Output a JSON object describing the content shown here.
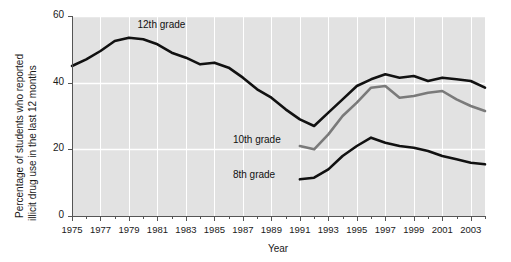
{
  "chart_data": {
    "type": "line",
    "title": "",
    "xlabel": "Year",
    "ylabel_line1": "Percentage of students who reported",
    "ylabel_line2": "illicit drug use in the last 12 months",
    "xlim": [
      1975,
      2004
    ],
    "ylim": [
      0,
      60
    ],
    "ytick_labels": [
      "0",
      "20",
      "40",
      "60"
    ],
    "yticks": [
      0,
      20,
      40,
      60
    ],
    "xtick_labels": [
      "1975",
      "1977",
      "1979",
      "1981",
      "1983",
      "1985",
      "1987",
      "1989",
      "1991",
      "1993",
      "1995",
      "1997",
      "1999",
      "2001",
      "2003"
    ],
    "xticks": [
      1975,
      1977,
      1979,
      1981,
      1983,
      1985,
      1987,
      1989,
      1991,
      1993,
      1995,
      1997,
      1999,
      2001,
      2003
    ],
    "grid": true,
    "legend_position": "inline-annotations",
    "plot_bg_color": "#e2e2e2",
    "grid_color": "#ffffff",
    "series": [
      {
        "name": "12th grade",
        "color": "#111111",
        "label_x": 1979.6,
        "label_y": 57.0,
        "x": [
          1975,
          1976,
          1977,
          1978,
          1979,
          1980,
          1981,
          1982,
          1983,
          1984,
          1985,
          1986,
          1987,
          1988,
          1989,
          1990,
          1991,
          1992,
          1993,
          1994,
          1995,
          1996,
          1997,
          1998,
          1999,
          2000,
          2001,
          2002,
          2003,
          2004
        ],
        "values": [
          45.0,
          47.0,
          49.5,
          52.5,
          53.5,
          53.0,
          51.5,
          49.0,
          47.5,
          45.5,
          46.0,
          44.5,
          41.5,
          38.0,
          35.5,
          32.0,
          29.0,
          27.0,
          31.0,
          35.0,
          39.0,
          41.0,
          42.5,
          41.5,
          42.0,
          40.5,
          41.5,
          41.0,
          40.5,
          38.5
        ]
      },
      {
        "name": "10th grade",
        "color": "#7a7a7a",
        "label_x": 1986.3,
        "label_y": 22.5,
        "x": [
          1991,
          1992,
          1993,
          1994,
          1995,
          1996,
          1997,
          1998,
          1999,
          2000,
          2001,
          2002,
          2003,
          2004
        ],
        "values": [
          21.0,
          20.0,
          24.5,
          30.0,
          34.0,
          38.5,
          39.0,
          35.5,
          36.0,
          37.0,
          37.5,
          35.0,
          33.0,
          31.5
        ]
      },
      {
        "name": "8th grade",
        "color": "#111111",
        "label_x": 1986.3,
        "label_y": 12.0,
        "x": [
          1991,
          1992,
          1993,
          1994,
          1995,
          1996,
          1997,
          1998,
          1999,
          2000,
          2001,
          2002,
          2003,
          2004
        ],
        "values": [
          11.0,
          11.5,
          14.0,
          18.0,
          21.0,
          23.5,
          22.0,
          21.0,
          20.5,
          19.5,
          18.0,
          17.0,
          16.0,
          15.5
        ]
      }
    ]
  }
}
